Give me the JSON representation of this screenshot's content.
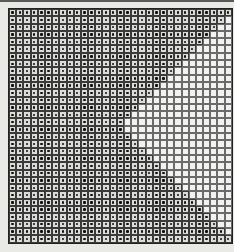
{
  "game": {
    "type": "grid-pattern",
    "columns": 31,
    "rows": 32,
    "filled_per_row": [
      31,
      30,
      29,
      28,
      27,
      26,
      25,
      24,
      23,
      22,
      21,
      20,
      19,
      18,
      17,
      16,
      16,
      17,
      18,
      19,
      20,
      21,
      22,
      23,
      24,
      25,
      26,
      27,
      28,
      29,
      30,
      31
    ],
    "colors": {
      "background": "#e9e9e6",
      "grid_line": "#3a3a3a",
      "dot": "#111111",
      "filled_cell": "#dcdcd8",
      "empty_cell": "#f2f2ef"
    }
  }
}
